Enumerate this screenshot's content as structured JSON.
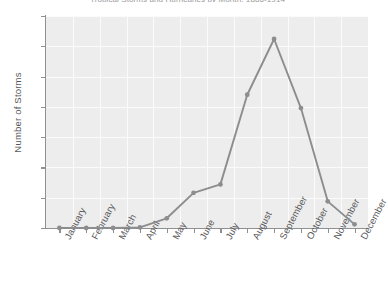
{
  "chart_data": {
    "type": "line",
    "title": "Tropical Storms and Hurricanes by Month, 1886-1914",
    "xlabel": "",
    "ylabel": "Number of Storms",
    "categories": [
      "January",
      "February",
      "March",
      "April",
      "May",
      "June",
      "July",
      "August",
      "September",
      "October",
      "November",
      "December"
    ],
    "values": [
      0,
      0,
      0,
      1,
      16,
      58,
      72,
      220,
      312,
      198,
      44,
      6
    ],
    "series": [
      {
        "name": "Number of Storms",
        "values": [
          0,
          0,
          0,
          1,
          16,
          58,
          72,
          220,
          312,
          198,
          44,
          6
        ]
      }
    ],
    "ylim": [
      0,
      350
    ],
    "y_ticks": [
      0,
      50,
      100,
      150,
      200,
      250,
      300,
      350
    ],
    "y_tick_labels": [
      "0",
      "50",
      "100",
      "150",
      "200",
      "250",
      "300",
      "350"
    ],
    "grid": true,
    "legend": "none",
    "colors": {
      "line": "#8c8d8f",
      "marker": "#8c8d8f",
      "plot_background": "#ededed",
      "gridline": "#fbfbfb",
      "axis": "#8f9092",
      "text": "#58585a",
      "figure_background": "#ffffff"
    }
  }
}
